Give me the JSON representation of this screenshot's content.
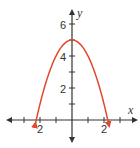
{
  "chart_data": {
    "type": "line",
    "title": "",
    "function": "y = -x^2 + 5",
    "xlabel": "x",
    "ylabel": "y",
    "xlim": [
      -3.5,
      3.5
    ],
    "ylim": [
      -1,
      6.5
    ],
    "x_tick_labels": [
      {
        "value": -2,
        "label": "2"
      },
      {
        "value": 2,
        "label": "2"
      }
    ],
    "y_tick_labels": [
      {
        "value": 2,
        "label": "2"
      },
      {
        "value": 4,
        "label": "4"
      },
      {
        "value": 6,
        "label": "6"
      }
    ],
    "series": [
      {
        "name": "parabola",
        "color": "#e0492e",
        "x": [
          -2.3,
          -2,
          -1.5,
          -1,
          -0.5,
          0,
          0.5,
          1,
          1.5,
          2,
          2.3
        ],
        "y": [
          -0.29,
          1,
          2.75,
          4,
          4.75,
          5,
          4.75,
          4,
          2.75,
          1,
          -0.29
        ]
      }
    ],
    "vertex": [
      0,
      5
    ],
    "grid": false,
    "axis_color": "#333333"
  },
  "labels": {
    "x_axis": "x",
    "y_axis": "y",
    "y6": "6",
    "y4": "4",
    "y2": "2",
    "xneg2": "2",
    "xpos2": "2"
  }
}
